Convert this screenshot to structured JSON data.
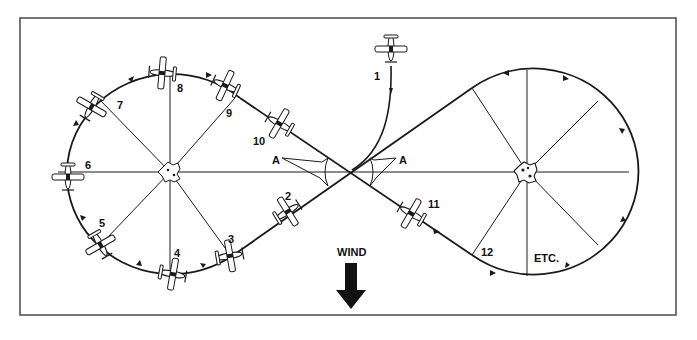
{
  "diagram": {
    "colors": {
      "line": "#1a1a1a",
      "border": "#555555",
      "background": "#ffffff"
    },
    "positions": [
      {
        "id": "1",
        "label": "1",
        "x": 374,
        "y": 78
      },
      {
        "id": "2",
        "label": "2",
        "x": 287,
        "y": 198
      },
      {
        "id": "3",
        "label": "3",
        "x": 231,
        "y": 242
      },
      {
        "id": "4",
        "label": "4",
        "x": 177,
        "y": 254
      },
      {
        "id": "5",
        "label": "5",
        "x": 102,
        "y": 226
      },
      {
        "id": "6",
        "label": "6",
        "x": 58,
        "y": 166
      },
      {
        "id": "7",
        "label": "7",
        "x": 120,
        "y": 108
      },
      {
        "id": "8",
        "label": "8",
        "x": 180,
        "y": 90
      },
      {
        "id": "9",
        "label": "9",
        "x": 228,
        "y": 116
      },
      {
        "id": "10",
        "label": "10",
        "x": 254,
        "y": 146
      },
      {
        "id": "11",
        "label": "11",
        "x": 428,
        "y": 208
      },
      {
        "id": "12",
        "label": "12",
        "x": 478,
        "y": 256
      }
    ],
    "angle_labels": [
      {
        "label": "A",
        "x": 275,
        "y": 162
      },
      {
        "label": "A",
        "x": 401,
        "y": 162
      }
    ],
    "etc_label": "ETC.",
    "wind": {
      "label": "WIND",
      "direction": "down"
    },
    "pylons": [
      {
        "name": "left-pylon",
        "cx": 170,
        "cy": 172
      },
      {
        "name": "right-pylon",
        "cx": 527,
        "cy": 172
      }
    ]
  }
}
